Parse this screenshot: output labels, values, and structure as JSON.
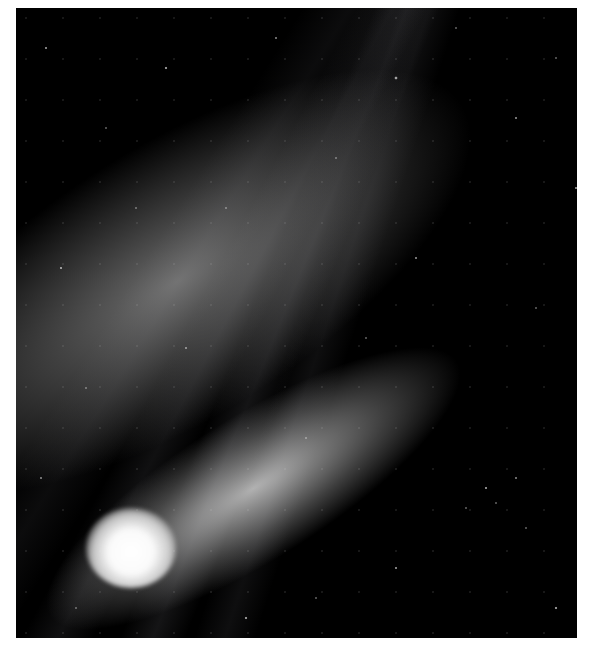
{
  "image": {
    "subject": "comet with bright coma and broad dust tail against star field",
    "colors": {
      "background": "#ffffff",
      "sky": "#000000",
      "coma": "#ffffff",
      "tail": "#bfbfbf"
    }
  }
}
